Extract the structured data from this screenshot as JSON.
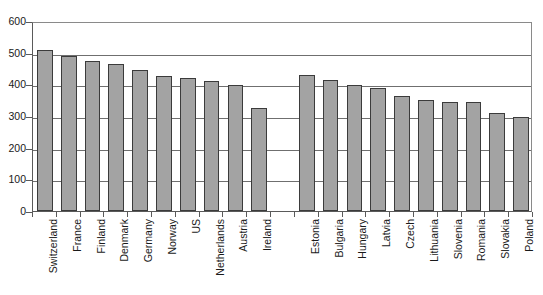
{
  "chart_data": {
    "type": "bar",
    "title": "",
    "subtitle": "",
    "xlabel": "",
    "ylabel": "",
    "ylim": [
      0,
      600
    ],
    "ytick_step": 100,
    "yticks": [
      0,
      100,
      200,
      300,
      400,
      500,
      600
    ],
    "ytick_labels": [
      "0",
      "100",
      "200",
      "300",
      "400",
      "500",
      "600"
    ],
    "grid": "horizontal",
    "legend": "none",
    "bar_color": "#a3a3a3",
    "bar_border_color": "#3b3b3b",
    "axis_color": "#5a5a5a",
    "gridline_color": "#6f6f6f",
    "categories": [
      "Switzerland",
      "France",
      "Finland",
      "Denmark",
      "Germany",
      "Norway",
      "US",
      "Netherlands",
      "Austria",
      "Ireland",
      "",
      "Estonia",
      "Bulgaria",
      "Hungary",
      "Latvia",
      "Czech",
      "Lithuania",
      "Slovenia",
      "Romania",
      "Slovakia",
      "Poland"
    ],
    "values": [
      510,
      490,
      475,
      465,
      445,
      425,
      420,
      410,
      398,
      325,
      null,
      428,
      415,
      398,
      388,
      363,
      350,
      345,
      345,
      310,
      297
    ]
  }
}
